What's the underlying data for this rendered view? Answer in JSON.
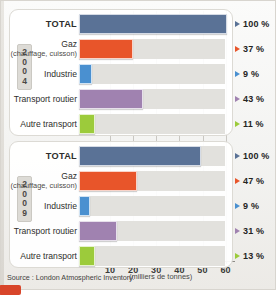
{
  "source": {
    "text": "Source : London Atmospheric Inventory."
  },
  "axis": {
    "unit_label": "(milliers de tonnes)",
    "ticks": [
      10,
      20,
      30,
      40,
      50,
      60
    ]
  },
  "panels": [
    {
      "year": "2004",
      "year_digits": [
        "2",
        "0",
        "0",
        "4"
      ],
      "rows": [
        {
          "label": "TOTAL",
          "sublabel": "",
          "value": 64.0,
          "percent": "100 %",
          "color": "#5a7296"
        },
        {
          "label": "Gaz",
          "sublabel": "(chauffage, cuisson)",
          "value": 23.5,
          "percent": "37 %",
          "color": "#e8552a"
        },
        {
          "label": "Industrie",
          "sublabel": "",
          "value": 5.5,
          "percent": "9 %",
          "color": "#4a90d0"
        },
        {
          "label": "Transport routier",
          "sublabel": "",
          "value": 27.5,
          "percent": "43 %",
          "color": "#a082b0"
        },
        {
          "label": "Autre transport",
          "sublabel": "",
          "value": 7.0,
          "percent": "11 %",
          "color": "#9ccb3b"
        }
      ]
    },
    {
      "year": "2009",
      "year_digits": [
        "2",
        "0",
        "0",
        "9"
      ],
      "rows": [
        {
          "label": "TOTAL",
          "sublabel": "",
          "value": 53.0,
          "percent": "100 %",
          "color": "#5a7296"
        },
        {
          "label": "Gaz",
          "sublabel": "(chauffage, cuisson)",
          "value": 25.0,
          "percent": "47 %",
          "color": "#e8552a"
        },
        {
          "label": "Industrie",
          "sublabel": "",
          "value": 4.8,
          "percent": "9 %",
          "color": "#4a90d0"
        },
        {
          "label": "Transport routier",
          "sublabel": "",
          "value": 16.5,
          "percent": "31 %",
          "color": "#a082b0"
        },
        {
          "label": "Autre transport",
          "sublabel": "",
          "value": 7.0,
          "percent": "13 %",
          "color": "#9ccb3b"
        }
      ]
    }
  ],
  "chart_data": {
    "type": "bar",
    "title": "",
    "subtitle": "",
    "orientation": "horizontal",
    "xlabel": "(milliers de tonnes)",
    "ylabel": "",
    "xlim": [
      0,
      65
    ],
    "xticks": [
      10,
      20,
      30,
      40,
      50,
      60
    ],
    "grid": true,
    "legend": "none",
    "categories": [
      "TOTAL",
      "Gaz (chauffage, cuisson)",
      "Industrie",
      "Transport routier",
      "Autre transport"
    ],
    "series": [
      {
        "name": "2004",
        "values": [
          64.0,
          23.5,
          5.5,
          27.5,
          7.0
        ],
        "labels": [
          "100 %",
          "37 %",
          "9 %",
          "43 %",
          "11 %"
        ]
      },
      {
        "name": "2009",
        "values": [
          53.0,
          25.0,
          4.8,
          16.5,
          7.0
        ],
        "labels": [
          "100 %",
          "47 %",
          "9 %",
          "31 %",
          "13 %"
        ]
      }
    ],
    "colors": {
      "TOTAL": "#5a7296",
      "Gaz (chauffage, cuisson)": "#e8552a",
      "Industrie": "#4a90d0",
      "Transport routier": "#a082b0",
      "Autre transport": "#9ccb3b"
    },
    "annotations": [
      "Source : London Atmospheric Inventory."
    ]
  }
}
